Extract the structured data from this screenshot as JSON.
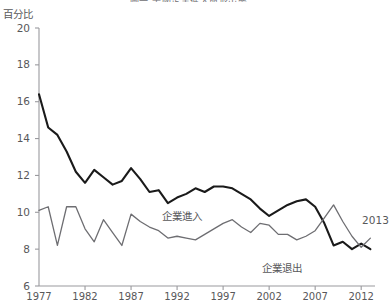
{
  "title": "圖一 美國企業進入與退出率",
  "axis_unit": "百分比",
  "annotations": [
    {
      "text": "2013",
      "x": 2012.1,
      "y": 9.55
    }
  ],
  "series_labels": [
    {
      "text": "企業進入",
      "x": 1993.2,
      "y": 9.85
    },
    {
      "text": "企業退出",
      "x": 2004.0,
      "y": 7.05
    }
  ],
  "colors": {
    "entry_line": "#1a1a1a",
    "exit_line": "#6e6e72",
    "axis": "#9a9a9e",
    "text": "#58585a",
    "background": "#ffffff"
  },
  "chart_data": {
    "type": "line",
    "title": "圖一 美國企業進入與退出率",
    "xlabel": "",
    "ylabel": "百分比",
    "xlim": [
      1977,
      2013.5
    ],
    "ylim": [
      6,
      20
    ],
    "yticks": [
      6,
      8,
      10,
      12,
      14,
      16,
      18,
      20
    ],
    "xticks": [
      1977,
      1982,
      1987,
      1992,
      1997,
      2002,
      2007,
      2012
    ],
    "xtick_labels": [
      "1977",
      "1982",
      "1987",
      "1992",
      "1997",
      "2002",
      "2007",
      "2012"
    ],
    "grid": false,
    "legend": "inline-labels",
    "x": [
      1977,
      1978,
      1979,
      1980,
      1981,
      1982,
      1983,
      1984,
      1985,
      1986,
      1987,
      1988,
      1989,
      1990,
      1991,
      1992,
      1993,
      1994,
      1995,
      1996,
      1997,
      1998,
      1999,
      2000,
      2001,
      2002,
      2003,
      2004,
      2005,
      2006,
      2007,
      2008,
      2009,
      2010,
      2011,
      2012,
      2013
    ],
    "series": [
      {
        "name": "企業進入",
        "color": "#1a1a1a",
        "values": [
          16.4,
          14.6,
          14.2,
          13.3,
          12.2,
          11.6,
          12.3,
          11.9,
          11.5,
          11.7,
          12.4,
          11.8,
          11.1,
          11.2,
          10.5,
          10.8,
          11.0,
          11.3,
          11.1,
          11.4,
          11.4,
          11.3,
          11.0,
          10.7,
          10.2,
          9.8,
          10.1,
          10.4,
          10.6,
          10.7,
          10.3,
          9.4,
          8.2,
          8.4,
          8.0,
          8.3,
          8.0
        ]
      },
      {
        "name": "企業退出",
        "color": "#6e6e72",
        "values": [
          10.1,
          10.3,
          8.2,
          10.3,
          10.3,
          9.1,
          8.4,
          9.6,
          8.9,
          8.2,
          9.9,
          9.5,
          9.2,
          9.0,
          8.6,
          8.7,
          8.6,
          8.5,
          8.8,
          9.1,
          9.4,
          9.6,
          9.2,
          8.9,
          9.4,
          9.3,
          8.8,
          8.8,
          8.5,
          8.7,
          9.0,
          9.7,
          10.4,
          9.5,
          8.7,
          8.1,
          8.6
        ]
      }
    ]
  }
}
